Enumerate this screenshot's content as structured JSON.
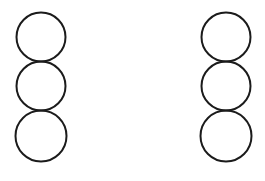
{
  "figure": {
    "canvas": {
      "width": 265,
      "height": 181,
      "background_color": "#ffffff"
    },
    "style": {
      "stroke_color": "#1b1b1b",
      "stroke_width": 2,
      "fill": "none"
    },
    "groups": [
      {
        "name": "left-stack",
        "label": "Left column of three circles",
        "circles": [
          {
            "name": "left-circle-top",
            "cx": 41,
            "cy": 37,
            "r": 24.5
          },
          {
            "name": "left-circle-middle",
            "cx": 41,
            "cy": 86,
            "r": 24.5
          },
          {
            "name": "left-circle-bottom",
            "cx": 41,
            "cy": 136,
            "r": 25.5
          }
        ]
      },
      {
        "name": "right-stack",
        "label": "Right column of three circles",
        "circles": [
          {
            "name": "right-circle-top",
            "cx": 226,
            "cy": 37,
            "r": 24.5
          },
          {
            "name": "right-circle-middle",
            "cx": 226,
            "cy": 86,
            "r": 24.5
          },
          {
            "name": "right-circle-bottom",
            "cx": 226,
            "cy": 136,
            "r": 25.5
          }
        ]
      }
    ]
  }
}
